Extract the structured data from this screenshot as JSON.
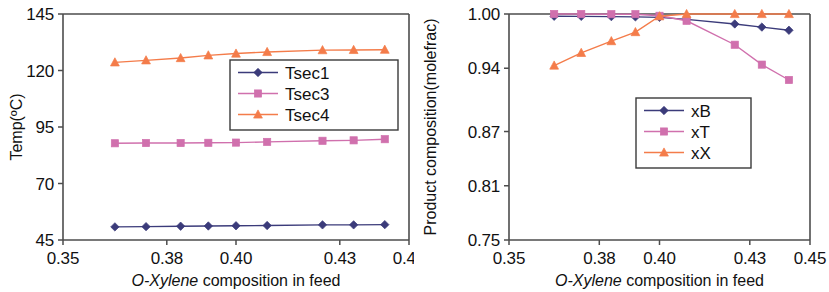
{
  "figure": {
    "panel_count": 2
  },
  "chart_data": [
    {
      "id": "left",
      "type": "line",
      "title": "",
      "xlabel": "O-Xylene composition in feed",
      "xlabel_italic_part": "O-Xylene",
      "ylabel": "Temp(ºC)",
      "xlim": [
        0.35,
        0.45
      ],
      "ylim": [
        45,
        145
      ],
      "xticks": [
        0.35,
        0.38,
        0.4,
        0.43,
        0.45
      ],
      "xticklabels": [
        "0.35",
        "0.38",
        "0.40",
        "0.43",
        "0.45"
      ],
      "yticks": [
        45,
        70,
        95,
        120,
        145
      ],
      "yticklabels": [
        "45",
        "70",
        "95",
        "120",
        "145"
      ],
      "grid": false,
      "legend_position": "center-right",
      "x": [
        0.365,
        0.374,
        0.384,
        0.392,
        0.4,
        0.409,
        0.425,
        0.434,
        0.443
      ],
      "series": [
        {
          "name": "Tsec1",
          "color": "#3b3b7a",
          "marker": "diamond",
          "values": [
            50.8,
            50.9,
            51.1,
            51.2,
            51.3,
            51.4,
            51.7,
            51.7,
            51.8
          ]
        },
        {
          "name": "Tsec3",
          "color": "#d070ad",
          "marker": "square",
          "values": [
            87.8,
            87.9,
            87.9,
            88.0,
            88.1,
            88.4,
            88.9,
            89.1,
            89.6
          ]
        },
        {
          "name": "Tsec4",
          "color": "#f47c4a",
          "marker": "triangle",
          "values": [
            123.6,
            124.5,
            125.5,
            126.7,
            127.5,
            128.2,
            129.0,
            129.1,
            129.2
          ]
        }
      ]
    },
    {
      "id": "right",
      "type": "line",
      "title": "",
      "xlabel": "O-Xylene composition in feed",
      "xlabel_italic_part": "O-Xylene",
      "ylabel": "Product composition(molefrac)",
      "xlim": [
        0.35,
        0.45
      ],
      "ylim": [
        0.75,
        1.0
      ],
      "xticks": [
        0.35,
        0.38,
        0.4,
        0.43,
        0.45
      ],
      "xticklabels": [
        "0.35",
        "0.38",
        "0.40",
        "0.43",
        "0.45"
      ],
      "yticks": [
        0.75,
        0.81,
        0.87,
        0.94,
        1.0
      ],
      "yticklabels": [
        "0.75",
        "0.81",
        "0.87",
        "0.94",
        "1.00"
      ],
      "grid": false,
      "legend_position": "lower-right",
      "x": [
        0.365,
        0.374,
        0.384,
        0.392,
        0.4,
        0.409,
        0.425,
        0.434,
        0.443
      ],
      "series": [
        {
          "name": "xB",
          "color": "#3b3b7a",
          "marker": "diamond",
          "values": [
            0.9975,
            0.9974,
            0.9971,
            0.9968,
            0.9963,
            0.994,
            0.989,
            0.9855,
            0.982
          ]
        },
        {
          "name": "xT",
          "color": "#d070ad",
          "marker": "square",
          "values": [
            1.0,
            1.0,
            0.9998,
            0.9998,
            0.998,
            0.9925,
            0.966,
            0.944,
            0.927
          ]
        },
        {
          "name": "xX",
          "color": "#f47c4a",
          "marker": "triangle",
          "values": [
            0.943,
            0.957,
            0.97,
            0.98,
            0.9975,
            1.0,
            1.0,
            1.0,
            1.0
          ]
        }
      ]
    }
  ]
}
